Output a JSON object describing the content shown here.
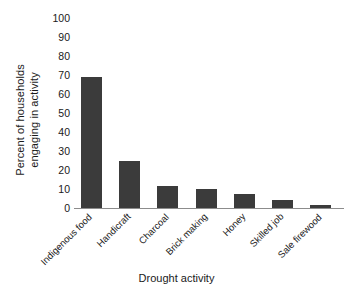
{
  "chart_data": {
    "type": "bar",
    "title": "",
    "xlabel": "Drought activity",
    "ylabel": "Percent of households engaging in activity",
    "ylabel_lines": [
      "Percent of households",
      "engaging in activity"
    ],
    "categories": [
      "Indigenous food",
      "Handicraft",
      "Charcoal",
      "Brick making",
      "Honey",
      "Skilled job",
      "Sale firewood"
    ],
    "values": [
      69,
      25,
      11.5,
      10,
      7.5,
      4,
      1.5
    ],
    "ylim": [
      0,
      100
    ],
    "yticks": [
      0,
      10,
      20,
      30,
      40,
      50,
      60,
      70,
      80,
      90,
      100
    ],
    "ytick_labels": [
      "0",
      "10",
      "20",
      "30",
      "40",
      "50",
      "60",
      "70",
      "80",
      "90",
      "100"
    ],
    "grid": false,
    "legend": null,
    "bar_color": "#3b3b3b",
    "background_color": "#ffffff",
    "axis_color": "#8c8c8c"
  }
}
